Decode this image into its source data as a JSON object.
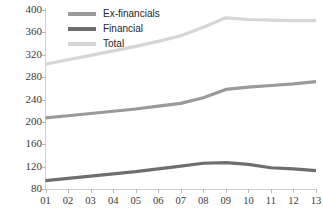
{
  "chart_data": {
    "type": "line",
    "title": "",
    "xlabel": "",
    "ylabel": "",
    "categories": [
      "01",
      "02",
      "03",
      "04",
      "05",
      "06",
      "07",
      "08",
      "09",
      "10",
      "11",
      "12",
      "13"
    ],
    "ylim": [
      80,
      400
    ],
    "ytick_values": [
      80,
      120,
      160,
      200,
      240,
      280,
      320,
      360,
      400
    ],
    "ytick_labels": [
      "80",
      "120",
      "160",
      "200",
      "240",
      "280",
      "320",
      "360",
      "400"
    ],
    "grid": false,
    "legend_position": "top-center",
    "series": [
      {
        "name": "Ex-financials",
        "color": "#9a9a9a",
        "values": [
          207,
          211,
          215,
          219,
          223,
          228,
          233,
          243,
          258,
          262,
          265,
          268,
          272
        ]
      },
      {
        "name": "Financial",
        "color": "#6e6e6e",
        "values": [
          95,
          99,
          103,
          107,
          111,
          116,
          121,
          126,
          127,
          124,
          118,
          116,
          113
        ]
      },
      {
        "name": "Total",
        "color": "#d6d6d6",
        "values": [
          303,
          311,
          319,
          327,
          335,
          344,
          354,
          369,
          386,
          383,
          382,
          381,
          381
        ]
      }
    ]
  },
  "legend": {
    "items": [
      {
        "label": "Ex-financials",
        "color": "#9a9a9a"
      },
      {
        "label": "Financial",
        "color": "#6e6e6e"
      },
      {
        "label": "Total",
        "color": "#d6d6d6"
      }
    ]
  },
  "axes": {
    "axis_color": "#d0d0d0",
    "tick_color": "#b8b8b8",
    "label_color": "#3a3a3a"
  }
}
